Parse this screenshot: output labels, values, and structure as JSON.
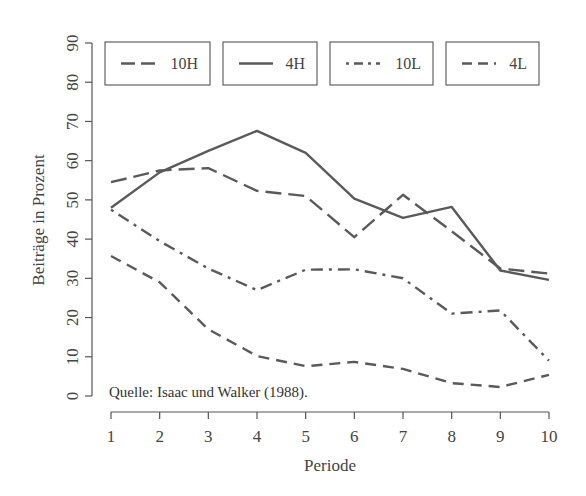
{
  "chart_data": {
    "type": "line",
    "title": "",
    "xlabel": "Periode",
    "ylabel": "Beiträge in Prozent",
    "x": [
      1,
      2,
      3,
      4,
      5,
      6,
      7,
      8,
      9,
      10
    ],
    "xticks": [
      "1",
      "2",
      "3",
      "4",
      "5",
      "6",
      "7",
      "8",
      "9",
      "10"
    ],
    "yticks": [
      "0",
      "10",
      "20",
      "30",
      "40",
      "50",
      "60",
      "70",
      "80",
      "90"
    ],
    "ylim": [
      0,
      90
    ],
    "xlim": [
      1,
      10
    ],
    "grid": false,
    "legend_position": "top",
    "annotation": "Quelle: Isaac und Walker (1988).",
    "series": [
      {
        "name": "10H",
        "style": "longdash",
        "values": [
          54.5,
          57.5,
          58.1,
          52.3,
          51.0,
          40.5,
          51.3,
          42.0,
          32.5,
          31.2
        ]
      },
      {
        "name": "4H",
        "style": "solid",
        "values": [
          48.0,
          57.0,
          62.5,
          67.6,
          62.0,
          50.3,
          45.4,
          48.2,
          32.0,
          29.6
        ]
      },
      {
        "name": "10L",
        "style": "dotdash",
        "values": [
          47.5,
          39.5,
          32.5,
          27.0,
          32.2,
          32.3,
          30.0,
          21.0,
          21.8,
          9.0
        ]
      },
      {
        "name": "4L",
        "style": "dashed",
        "values": [
          35.7,
          29.0,
          17.0,
          10.2,
          7.6,
          8.7,
          6.9,
          3.3,
          2.3,
          5.4
        ]
      }
    ]
  }
}
